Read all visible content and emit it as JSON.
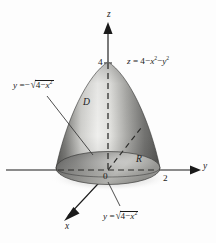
{
  "figure": {
    "background_color": "#fdfdfd",
    "ink_color": "#1a1a1a"
  },
  "axes": {
    "z": {
      "label": "z",
      "tick_label": "4",
      "tick_value": 4,
      "direction": "up"
    },
    "y": {
      "label": "y",
      "tick_label": "2",
      "tick_value": 2,
      "direction": "right"
    },
    "x": {
      "label": "x",
      "direction": "down-left"
    },
    "origin_label": "0"
  },
  "labels": {
    "surface_equation": {
      "lhs": "z",
      "eq": "=",
      "const": "4",
      "minus_1": "−",
      "term_1_base": "x",
      "term_1_exp": "2",
      "minus_2": "−",
      "term_2_base": "y",
      "term_2_exp": "2",
      "plain": "z = 4 − x² − y²"
    },
    "boundary_lower": {
      "lhs": "y",
      "eq": "=",
      "sign": "−",
      "radical": "√",
      "const": "4",
      "minus": "−",
      "term_base": "x",
      "term_exp": "2",
      "plain": "y = −√(4 − x²)"
    },
    "boundary_upper": {
      "lhs": "y",
      "eq": "=",
      "radical": "√",
      "const": "4",
      "minus": "−",
      "term_base": "x",
      "term_exp": "2",
      "plain": "y = √(4 − x²)"
    },
    "solid_region": "D",
    "base_region": "R"
  },
  "colors": {
    "surface_light": "#f2f2f0",
    "surface_mid": "#b9b9b6",
    "surface_dark": "#6a6a68",
    "surface_darkest": "#4b4b4a",
    "base_light": "#c9c9c6",
    "base_dark": "#565654",
    "axis": "#1a1a1a",
    "leader": "#3a3a3a"
  }
}
